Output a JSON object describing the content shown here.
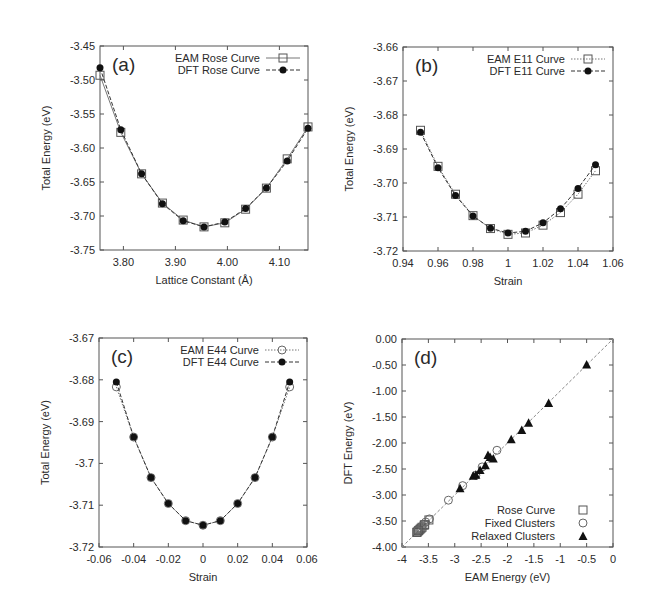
{
  "chart_data": [
    {
      "type": "line",
      "panel_label": "(a)",
      "xlabel": "Lattice Constant (Å)",
      "ylabel": "Total Energy (eV)",
      "xlim": [
        3.755,
        4.155
      ],
      "ylim": [
        -3.75,
        -3.45
      ],
      "xticks": [
        "3.80",
        "3.90",
        "4.00",
        "4.10"
      ],
      "xtick_values": [
        3.8,
        3.9,
        4.0,
        4.1
      ],
      "yticks": [
        "-3.45",
        "-3.50",
        "-3.55",
        "-3.60",
        "-3.65",
        "-3.70",
        "-3.75"
      ],
      "ytick_values": [
        -3.45,
        -3.5,
        -3.55,
        -3.6,
        -3.65,
        -3.7,
        -3.75
      ],
      "legend_position": "upper right",
      "x": [
        3.755,
        3.795,
        3.835,
        3.875,
        3.915,
        3.955,
        3.995,
        4.035,
        4.075,
        4.115,
        4.155
      ],
      "series": [
        {
          "name": "EAM Rose Curve",
          "marker": "open-square",
          "line": "solid",
          "values": [
            -3.493,
            -3.577,
            -3.638,
            -3.681,
            -3.706,
            -3.716,
            -3.71,
            -3.69,
            -3.659,
            -3.616,
            -3.569
          ]
        },
        {
          "name": "DFT Rose Curve",
          "marker": "filled-circle",
          "line": "dashed",
          "values": [
            -3.482,
            -3.573,
            -3.638,
            -3.682,
            -3.707,
            -3.716,
            -3.709,
            -3.689,
            -3.659,
            -3.619,
            -3.571
          ]
        }
      ]
    },
    {
      "type": "line",
      "panel_label": "(b)",
      "xlabel": "Strain",
      "ylabel": "Total Energy (eV)",
      "xlim": [
        0.94,
        1.06
      ],
      "ylim": [
        -3.72,
        -3.66
      ],
      "xticks": [
        "0.94",
        "0.96",
        "0.98",
        "1",
        "1.02",
        "1.04",
        "1.06"
      ],
      "xtick_values": [
        0.94,
        0.96,
        0.98,
        1.0,
        1.02,
        1.04,
        1.06
      ],
      "yticks": [
        "-3.66",
        "-3.67",
        "-3.68",
        "-3.69",
        "-3.70",
        "-3.71",
        "-3.72"
      ],
      "ytick_values": [
        -3.66,
        -3.67,
        -3.68,
        -3.69,
        -3.7,
        -3.71,
        -3.72
      ],
      "legend_position": "upper right",
      "x": [
        0.95,
        0.96,
        0.97,
        0.98,
        0.99,
        1.0,
        1.01,
        1.02,
        1.03,
        1.04,
        1.05
      ],
      "series": [
        {
          "name": "EAM E11 Curve",
          "marker": "open-square",
          "line": "dotted",
          "values": [
            -3.6845,
            -3.6951,
            -3.7033,
            -3.7096,
            -3.7134,
            -3.7151,
            -3.7147,
            -3.7124,
            -3.7087,
            -3.7033,
            -3.6964
          ]
        },
        {
          "name": "DFT E11 Curve",
          "marker": "filled-circle",
          "line": "dashed",
          "values": [
            -3.6851,
            -3.6955,
            -3.7037,
            -3.7097,
            -3.7133,
            -3.7147,
            -3.7142,
            -3.7117,
            -3.7076,
            -3.7016,
            -3.6946
          ]
        }
      ]
    },
    {
      "type": "line",
      "panel_label": "(c)",
      "xlabel": "Strain",
      "ylabel": "Total Energy (eV)",
      "xlim": [
        -0.06,
        0.06
      ],
      "ylim": [
        -3.72,
        -3.67
      ],
      "xticks": [
        "-0.06",
        "-0.04",
        "-0.02",
        "0",
        "0.02",
        "0.04",
        "0.06"
      ],
      "xtick_values": [
        -0.06,
        -0.04,
        -0.02,
        0,
        0.02,
        0.04,
        0.06
      ],
      "yticks": [
        "-3.67",
        "-3.68",
        "-3.69",
        "-3.7",
        "-3.71",
        "-3.72"
      ],
      "ytick_values": [
        -3.67,
        -3.68,
        -3.69,
        -3.7,
        -3.71,
        -3.72
      ],
      "legend_position": "upper right",
      "x": [
        -0.05,
        -0.04,
        -0.03,
        -0.02,
        -0.01,
        0.0,
        0.01,
        0.02,
        0.03,
        0.04,
        0.05
      ],
      "series": [
        {
          "name": "EAM E44 Curve",
          "marker": "open-circle",
          "line": "dotted",
          "values": [
            -3.6817,
            -3.6937,
            -3.7034,
            -3.7096,
            -3.7137,
            -3.7148,
            -3.7137,
            -3.7096,
            -3.7034,
            -3.6937,
            -3.6817
          ]
        },
        {
          "name": "DFT E44 Curve",
          "marker": "filled-circle",
          "line": "dashed",
          "values": [
            -3.6805,
            -3.6937,
            -3.7034,
            -3.7096,
            -3.7137,
            -3.7148,
            -3.7137,
            -3.7096,
            -3.7034,
            -3.6937,
            -3.6805
          ]
        }
      ]
    },
    {
      "type": "scatter",
      "panel_label": "(d)",
      "xlabel": "EAM Energy (eV)",
      "ylabel": "DFT Energy (eV)",
      "xlim": [
        -4,
        0
      ],
      "ylim": [
        -4.0,
        0.0
      ],
      "xticks": [
        "-4",
        "-3.5",
        "-3",
        "-2.5",
        "-2",
        "-1.5",
        "-1",
        "-0.5",
        "0"
      ],
      "xtick_values": [
        -4,
        -3.5,
        -3,
        -2.5,
        -2,
        -1.5,
        -1,
        -0.5,
        0
      ],
      "yticks": [
        "0.00",
        "-0.50",
        "-1.00",
        "-1.50",
        "-2.00",
        "-2.50",
        "-3.00",
        "-3.50",
        "-4.00"
      ],
      "ytick_values": [
        0,
        -0.5,
        -1.0,
        -1.5,
        -2.0,
        -2.5,
        -3.0,
        -3.5,
        -4.0
      ],
      "reference_line": "y = x (dashed)",
      "legend_position": "lower right",
      "series": [
        {
          "name": "Rose Curve",
          "marker": "open-square",
          "x": [
            -3.72,
            -3.71,
            -3.69,
            -3.68,
            -3.66,
            -3.64,
            -3.62,
            -3.58,
            -3.57,
            -3.49
          ],
          "y": [
            -3.72,
            -3.71,
            -3.69,
            -3.68,
            -3.66,
            -3.64,
            -3.62,
            -3.58,
            -3.57,
            -3.48
          ]
        },
        {
          "name": "Fixed Clusters",
          "marker": "open-circle",
          "x": [
            -3.7,
            -3.62,
            -3.55,
            -3.48,
            -3.12,
            -2.85,
            -2.6,
            -2.48,
            -2.2
          ],
          "y": [
            -3.68,
            -3.6,
            -3.52,
            -3.46,
            -3.1,
            -2.82,
            -2.62,
            -2.46,
            -2.14
          ]
        },
        {
          "name": "Relaxed Clusters",
          "marker": "filled-triangle",
          "x": [
            -0.5,
            -1.22,
            -1.6,
            -1.73,
            -1.93,
            -2.27,
            -2.33,
            -2.37,
            -2.42,
            -2.52,
            -2.6,
            -2.65,
            -2.9
          ],
          "y": [
            -0.49,
            -1.23,
            -1.61,
            -1.75,
            -1.93,
            -2.3,
            -2.27,
            -2.23,
            -2.43,
            -2.52,
            -2.61,
            -2.63,
            -2.87
          ]
        }
      ]
    }
  ]
}
